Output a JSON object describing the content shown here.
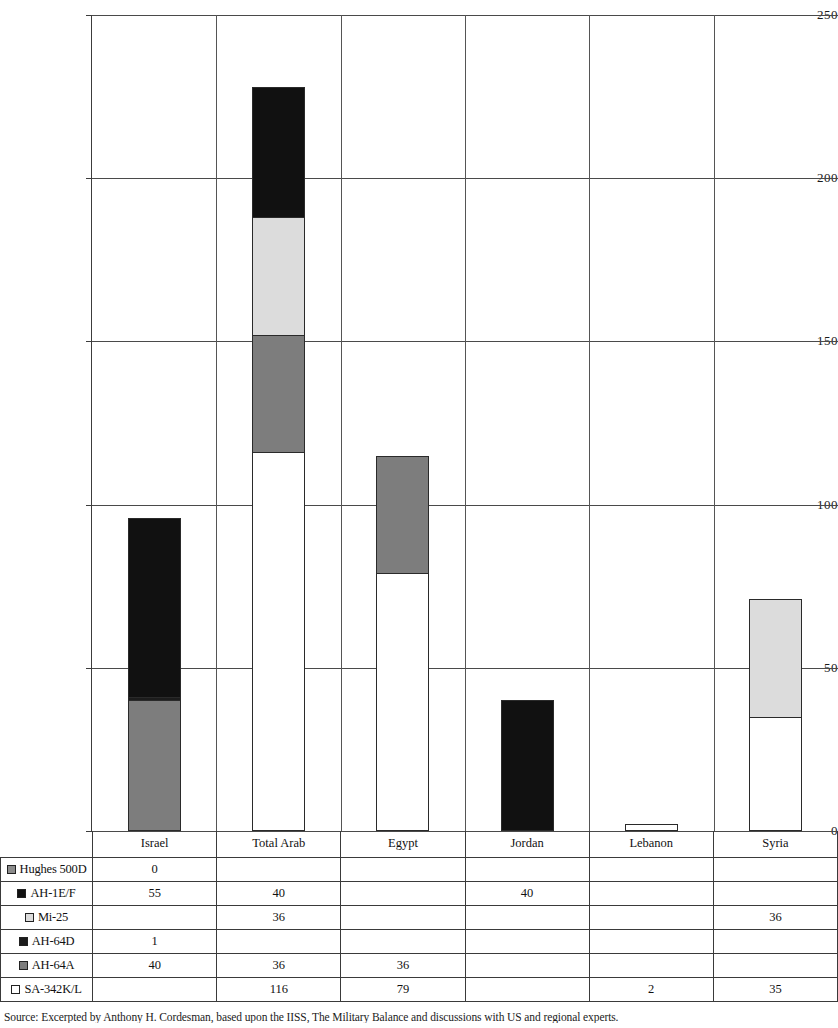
{
  "chart_data": {
    "type": "bar",
    "subtype": "stacked-bar",
    "title": "",
    "xlabel": "",
    "ylabel": "",
    "ylim": [
      0,
      250
    ],
    "ytick_labels": [
      "0",
      "50",
      "100",
      "150",
      "200",
      "250"
    ],
    "ytick_values": [
      0,
      50,
      100,
      150,
      200,
      250
    ],
    "grid": true,
    "legend_position": "table-row-labels",
    "categories": [
      "Israel",
      "Total Arab",
      "Egypt",
      "Jordan",
      "Lebanon",
      "Syria"
    ],
    "series": [
      {
        "name": "Hughes 500D",
        "color": "#8c8c8c",
        "values": [
          0,
          null,
          null,
          null,
          null,
          null
        ]
      },
      {
        "name": "AH-1E/F",
        "color": "#111111",
        "values": [
          55,
          40,
          null,
          40,
          null,
          null
        ]
      },
      {
        "name": "Mi-25",
        "color": "#dcdcdc",
        "values": [
          null,
          36,
          null,
          null,
          null,
          36
        ]
      },
      {
        "name": "AH-64D",
        "color": "#1c1c1c",
        "values": [
          1,
          null,
          null,
          null,
          null,
          null
        ]
      },
      {
        "name": "AH-64A",
        "color": "#7d7d7d",
        "values": [
          40,
          36,
          36,
          null,
          null,
          null
        ]
      },
      {
        "name": "SA-342K/L",
        "color": "#ffffff",
        "values": [
          null,
          116,
          79,
          null,
          2,
          35
        ]
      }
    ],
    "totals": [
      96,
      228,
      115,
      40,
      2,
      71
    ],
    "table_display": {
      "Hughes 500D": [
        "0",
        "",
        "",
        "",
        "",
        ""
      ],
      "AH-1E/F": [
        "55",
        "40",
        "",
        "40",
        "",
        ""
      ],
      "Mi-25": [
        "",
        "36",
        "",
        "",
        "",
        "36"
      ],
      "AH-64D": [
        "1",
        "",
        "",
        "",
        "",
        ""
      ],
      "AH-64A": [
        "40",
        "36",
        "36",
        "",
        "",
        ""
      ],
      "SA-342K/L": [
        "",
        "116",
        "79",
        "",
        "2",
        "35"
      ]
    }
  },
  "caption": {
    "text": "Source: Excerpted by Anthony H. Cordesman, based upon the IISS, The Military Balance and discussions with US and regional experts."
  },
  "colors": {
    "hughes_500d": "#8c8c8c",
    "ah_1ef": "#111111",
    "mi_25": "#dcdcdc",
    "ah_64d": "#1c1c1c",
    "ah_64a": "#7d7d7d",
    "sa_342kl": "#ffffff",
    "grid": "#4a4a4a",
    "border": "#3a3a3a"
  }
}
